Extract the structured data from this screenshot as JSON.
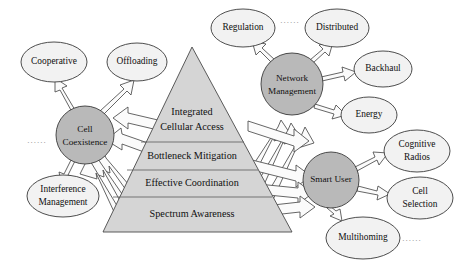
{
  "figure": {
    "type": "concept-diagram"
  },
  "pyramid": {
    "name": "integrated-cellular-access-pyramid",
    "tiers": [
      {
        "id": "tier-apex",
        "label_line1": "Integrated",
        "label_line2": "Cellular Access"
      },
      {
        "id": "tier-2",
        "label": "Bottleneck Mitigation"
      },
      {
        "id": "tier-3",
        "label": "Effective Coordination"
      },
      {
        "id": "tier-4",
        "label": "Spectrum Awareness"
      }
    ],
    "fill_color": "#d5d5d5",
    "stroke_color": "#4a4a4a"
  },
  "hubs": [
    {
      "id": "hub-cell-coexistence",
      "label_line1": "Cell",
      "label_line2": "Coexistence",
      "cx": 85,
      "cy": 135,
      "r": 29,
      "fill_color": "#b9b9b9"
    },
    {
      "id": "hub-network-management",
      "label_line1": "Network",
      "label_line2": "Management",
      "cx": 292,
      "cy": 84,
      "r": 31,
      "fill_color": "#b9b9b9"
    },
    {
      "id": "hub-smart-user",
      "label_line1": "Smart  User",
      "label_line2": "",
      "cx": 331,
      "cy": 180,
      "r": 28,
      "fill_color": "#b9b9b9"
    }
  ],
  "leaves": [
    {
      "id": "leaf-cooperative",
      "label_line1": "Cooperative",
      "label_line2": "",
      "cx": 54,
      "cy": 62,
      "rx": 33,
      "ry": 20,
      "hub": "hub-cell-coexistence"
    },
    {
      "id": "leaf-offloading",
      "label_line1": "Offloading",
      "label_line2": "",
      "cx": 137,
      "cy": 62,
      "rx": 30,
      "ry": 19,
      "hub": "hub-cell-coexistence"
    },
    {
      "id": "leaf-interference",
      "label_line1": "Interference",
      "label_line2": "Management",
      "cx": 63,
      "cy": 196,
      "rx": 36,
      "ry": 21,
      "hub": "hub-cell-coexistence"
    },
    {
      "id": "leaf-regulation",
      "label_line1": "Regulation",
      "label_line2": "",
      "cx": 243,
      "cy": 28,
      "rx": 32,
      "ry": 19,
      "hub": "hub-network-management"
    },
    {
      "id": "leaf-distributed",
      "label_line1": "Distributed",
      "label_line2": "",
      "cx": 337,
      "cy": 28,
      "rx": 32,
      "ry": 19,
      "hub": "hub-network-management"
    },
    {
      "id": "leaf-backhaul",
      "label_line1": "Backhaul",
      "label_line2": "",
      "cx": 383,
      "cy": 69,
      "rx": 29,
      "ry": 18,
      "hub": "hub-network-management"
    },
    {
      "id": "leaf-energy",
      "label_line1": "Energy",
      "label_line2": "",
      "cx": 369,
      "cy": 115,
      "rx": 28,
      "ry": 18,
      "hub": "hub-network-management"
    },
    {
      "id": "leaf-cognitive",
      "label_line1": "Cognitive",
      "label_line2": "Radios",
      "cx": 417,
      "cy": 151,
      "rx": 33,
      "ry": 21,
      "hub": "hub-smart-user"
    },
    {
      "id": "leaf-cell-selection",
      "label_line1": "Cell",
      "label_line2": "Selection",
      "cx": 420,
      "cy": 198,
      "rx": 33,
      "ry": 21,
      "hub": "hub-smart-user"
    },
    {
      "id": "leaf-multihoming",
      "label_line1": "Multihoming",
      "label_line2": "",
      "cx": 363,
      "cy": 238,
      "rx": 37,
      "ry": 21,
      "hub": "hub-smart-user"
    }
  ],
  "ellipses_marks": [
    {
      "id": "dots-left",
      "text": "......",
      "x": 37,
      "y": 140
    },
    {
      "id": "dots-top",
      "text": "......",
      "x": 290,
      "y": 20
    },
    {
      "id": "dots-bottom",
      "text": "......",
      "x": 412,
      "y": 238
    }
  ],
  "colors": {
    "background": "#ffffff",
    "pyramid_fill": "#d5d5d5",
    "hub_fill": "#b9b9b9",
    "leaf_fill": "#f2f2f2",
    "arrow_fill": "#fbfbfb",
    "stroke": "#3a3a3a",
    "text": "#101010"
  }
}
